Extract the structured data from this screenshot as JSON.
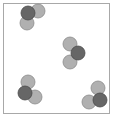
{
  "diagram": {
    "colors": {
      "background": "#ffffff",
      "border": "#a8a8a8",
      "dark_atom": "#666666",
      "dark_atom_stroke": "#4a4a4a",
      "light_atom": "#b0b0b0",
      "light_atom_stroke": "#8c8c8c"
    },
    "container": {
      "x": 3.5,
      "y": 3.5,
      "width": 106,
      "height": 110
    },
    "atom_radius": 7,
    "molecules": [
      {
        "name": "molecule-top-left",
        "atoms": [
          {
            "type": "light",
            "cx": 38,
            "cy": 11
          },
          {
            "type": "light",
            "cx": 27,
            "cy": 23
          },
          {
            "type": "dark",
            "cx": 28,
            "cy": 13
          }
        ]
      },
      {
        "name": "molecule-center",
        "atoms": [
          {
            "type": "light",
            "cx": 70,
            "cy": 44
          },
          {
            "type": "light",
            "cx": 70,
            "cy": 62
          },
          {
            "type": "dark",
            "cx": 78,
            "cy": 53
          }
        ]
      },
      {
        "name": "molecule-bottom-left",
        "atoms": [
          {
            "type": "light",
            "cx": 28,
            "cy": 82
          },
          {
            "type": "light",
            "cx": 35,
            "cy": 97
          },
          {
            "type": "dark",
            "cx": 25,
            "cy": 93
          }
        ]
      },
      {
        "name": "molecule-bottom-right",
        "atoms": [
          {
            "type": "light",
            "cx": 98,
            "cy": 88
          },
          {
            "type": "light",
            "cx": 89,
            "cy": 102
          },
          {
            "type": "dark",
            "cx": 100,
            "cy": 100
          }
        ]
      }
    ]
  }
}
